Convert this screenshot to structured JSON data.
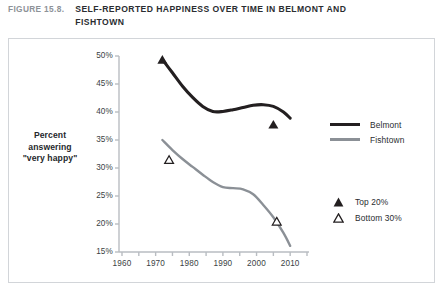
{
  "header": {
    "figure_number": "FIGURE 15.8.",
    "title": "SELF-REPORTED HAPPINESS OVER TIME IN BELMONT AND FISHTOWN"
  },
  "chart_data": {
    "type": "line",
    "title": "SELF-REPORTED HAPPINESS OVER TIME IN BELMONT AND FISHTOWN",
    "xlabel": "",
    "ylabel": "Percent answering \"very happy\"",
    "ylabel_lines": [
      "Percent",
      "answering",
      "\"very happy\""
    ],
    "xlim": [
      1958,
      2016
    ],
    "ylim": [
      15,
      50
    ],
    "grid": false,
    "legend_position": "right",
    "x_ticks": [
      1960,
      1970,
      1980,
      1990,
      2000,
      2010
    ],
    "x_tick_labels": [
      "1960",
      "1970",
      "1980",
      "1990",
      "2000",
      "2010"
    ],
    "x_minor_ticks": [
      1960,
      1965,
      1970,
      1975,
      1980,
      1985,
      1990,
      1995,
      2000,
      2005,
      2010,
      2015
    ],
    "y_ticks": [
      15,
      20,
      25,
      30,
      35,
      40,
      45,
      50
    ],
    "y_tick_labels": [
      "15%",
      "20%",
      "25%",
      "30%",
      "35%",
      "40%",
      "45%",
      "50%"
    ],
    "colors": {
      "belmont": "#231f20",
      "fishtown": "#8b9096",
      "axis": "#b9bdc2",
      "text": "#2a2d31",
      "figure_number": "#8d9298",
      "frame": "#d2d5d9"
    },
    "series": [
      {
        "name": "Belmont",
        "color": "#231f20",
        "line_width": 3.1,
        "x": [
          1972,
          1975,
          1978,
          1981,
          1984,
          1987,
          1990,
          1993,
          1996,
          1999,
          2002,
          2005,
          2008,
          2010
        ],
        "values": [
          49.4,
          47.0,
          44.6,
          42.6,
          41.0,
          40.1,
          40.1,
          40.4,
          40.8,
          41.2,
          41.3,
          41.0,
          40.0,
          38.9
        ]
      },
      {
        "name": "Fishtown",
        "color": "#8b9096",
        "line_width": 2.4,
        "x": [
          1972,
          1975,
          1978,
          1981,
          1984,
          1987,
          1990,
          1993,
          1996,
          1999,
          2002,
          2005,
          2008,
          2010
        ],
        "values": [
          35.0,
          33.2,
          31.6,
          30.2,
          28.8,
          27.5,
          26.6,
          26.4,
          26.2,
          25.3,
          23.4,
          21.2,
          18.4,
          16.1
        ]
      }
    ],
    "markers": [
      {
        "label": "Top 20%",
        "style": "filled-triangle",
        "x": 1972,
        "y": 49.4
      },
      {
        "label": "Top 20%",
        "style": "filled-triangle",
        "x": 2005,
        "y": 37.8
      },
      {
        "label": "Bottom 30%",
        "style": "open-triangle",
        "x": 1974,
        "y": 31.5
      },
      {
        "label": "Bottom 30%",
        "style": "open-triangle",
        "x": 2006,
        "y": 20.5
      }
    ],
    "legend": {
      "lines": [
        {
          "label": "Belmont",
          "color": "#231f20"
        },
        {
          "label": "Fishtown",
          "color": "#8b9096"
        }
      ],
      "markers": [
        {
          "label": "Top 20%",
          "style": "filled-triangle"
        },
        {
          "label": "Bottom 30%",
          "style": "open-triangle"
        }
      ]
    }
  }
}
